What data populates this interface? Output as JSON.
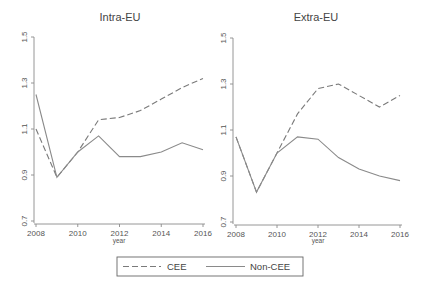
{
  "chart_data": [
    {
      "type": "line",
      "title": "Intra-EU",
      "xlabel": "year",
      "ylabel": "",
      "x": [
        2008,
        2009,
        2010,
        2011,
        2012,
        2013,
        2014,
        2015,
        2016
      ],
      "xticks": [
        "2008",
        "2010",
        "2012",
        "2014",
        "2016"
      ],
      "yticks": [
        "0.7",
        "0.9",
        "1.1",
        "1.3",
        "1.5"
      ],
      "ylim": [
        0.7,
        1.5
      ],
      "grid": false,
      "series": [
        {
          "name": "CEE",
          "style": "dashed",
          "values": [
            1.1,
            0.89,
            1.0,
            1.14,
            1.15,
            1.18,
            1.23,
            1.28,
            1.32
          ]
        },
        {
          "name": "Non-CEE",
          "style": "solid",
          "values": [
            1.25,
            0.89,
            1.0,
            1.07,
            0.98,
            0.98,
            1.0,
            1.04,
            1.01
          ]
        }
      ]
    },
    {
      "type": "line",
      "title": "Extra-EU",
      "xlabel": "year",
      "ylabel": "",
      "x": [
        2008,
        2009,
        2010,
        2011,
        2012,
        2013,
        2014,
        2015,
        2016
      ],
      "xticks": [
        "2008",
        "2010",
        "2012",
        "2014",
        "2016"
      ],
      "yticks": [
        "0.7",
        "0.9",
        "1.1",
        "1.3",
        "1.5"
      ],
      "ylim": [
        0.7,
        1.5
      ],
      "grid": false,
      "series": [
        {
          "name": "CEE",
          "style": "dashed",
          "values": [
            1.07,
            0.83,
            1.0,
            1.17,
            1.28,
            1.3,
            1.25,
            1.2,
            1.25
          ]
        },
        {
          "name": "Non-CEE",
          "style": "solid",
          "values": [
            1.07,
            0.83,
            1.0,
            1.07,
            1.06,
            0.98,
            0.93,
            0.9,
            0.88
          ]
        }
      ]
    }
  ],
  "legend": {
    "position": "bottom",
    "entries": [
      {
        "label": "CEE",
        "style": "dashed"
      },
      {
        "label": "Non-CEE",
        "style": "solid"
      }
    ]
  }
}
